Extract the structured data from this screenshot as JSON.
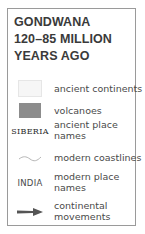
{
  "title": {
    "line1": "GONDWANA",
    "line2": "120–85 MILLION",
    "line3": "YEARS AGO"
  },
  "legend": {
    "items": [
      {
        "symbol": "light-swatch",
        "label_line1": "ancient continents",
        "label_line2": ""
      },
      {
        "symbol": "dark-swatch",
        "label_line1": "volcanoes",
        "label_line2": ""
      },
      {
        "symbol_text": "SIBERIA",
        "label_line1": "ancient place",
        "label_line2": "names"
      },
      {
        "symbol": "wavy-line",
        "label_line1": "modern coastlines",
        "label_line2": ""
      },
      {
        "symbol_text": "INDIA",
        "label_line1": "modern place",
        "label_line2": "names"
      },
      {
        "symbol": "arrow",
        "label_line1": "continental",
        "label_line2": "movements"
      }
    ]
  },
  "colors": {
    "border": "#9a9a9a",
    "title": "#3a3a3a",
    "ancient_continents": "#f6f6f6",
    "volcanoes": "#8c8c8c",
    "coastline": "#b5b5b5",
    "arrow": "#555555"
  }
}
